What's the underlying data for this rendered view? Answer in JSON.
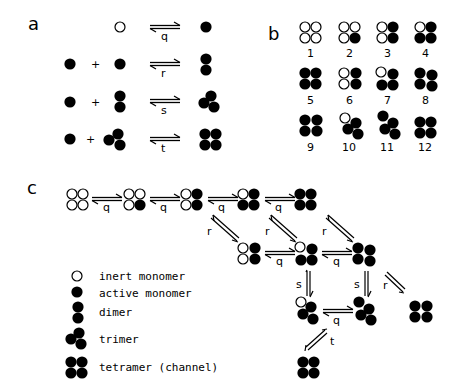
{
  "panels": {
    "a": {
      "label": "a",
      "reactions": [
        {
          "rate": "q",
          "left": [
            "inert-monomer"
          ],
          "right": "active-monomer"
        },
        {
          "rate": "r",
          "left": [
            "active-monomer",
            "active-monomer"
          ],
          "plus": "+",
          "right": "dimer"
        },
        {
          "rate": "s",
          "left": [
            "active-monomer",
            "dimer"
          ],
          "plus": "+",
          "right": "trimer"
        },
        {
          "rate": "t",
          "left": [
            "active-monomer",
            "trimer"
          ],
          "plus": "+",
          "right": "tetramer"
        }
      ]
    },
    "b": {
      "label": "b",
      "states": [
        {
          "n": "1"
        },
        {
          "n": "2"
        },
        {
          "n": "3"
        },
        {
          "n": "4"
        },
        {
          "n": "5"
        },
        {
          "n": "6"
        },
        {
          "n": "7"
        },
        {
          "n": "8"
        },
        {
          "n": "9"
        },
        {
          "n": "10"
        },
        {
          "n": "11"
        },
        {
          "n": "12"
        }
      ]
    },
    "c": {
      "label": "c",
      "rates": {
        "q": "q",
        "r": "r",
        "s": "s",
        "t": "t"
      },
      "legend": [
        {
          "icon": "inert-monomer",
          "text": "inert monomer"
        },
        {
          "icon": "active-monomer",
          "text": "active monomer"
        },
        {
          "icon": "dimer",
          "text": "dimer"
        },
        {
          "icon": "trimer",
          "text": "trimer"
        },
        {
          "icon": "tetramer",
          "text": "tetramer (channel)"
        }
      ]
    }
  },
  "colors": {
    "ink": "#000000",
    "background": "#ffffff"
  }
}
